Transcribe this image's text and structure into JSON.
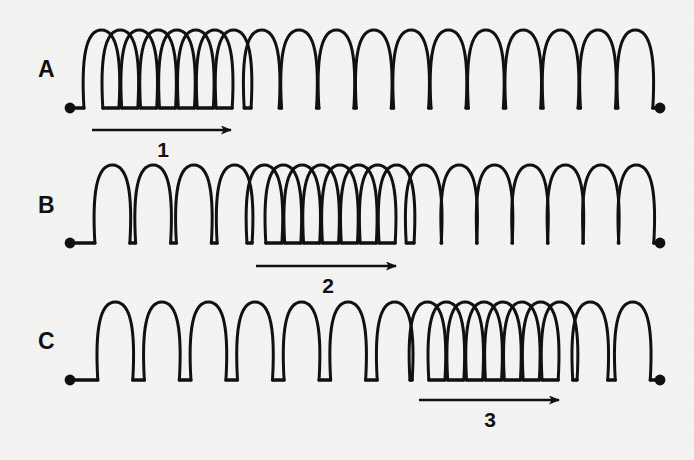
{
  "figure": {
    "background_color": "#f4f4f2",
    "ink_color": "#111111",
    "width": 694,
    "height": 460
  },
  "chart_data": {
    "type": "diagram",
    "xlabel": "",
    "ylabel": "",
    "grid": false,
    "legend": false,
    "springs": [
      {
        "label": "A",
        "label_x": 38,
        "label_y": 58,
        "baseline_y": 108,
        "start_x": 70,
        "end_x": 660,
        "coil_height": 78,
        "compression_start_x": 92,
        "compression_end_x": 243,
        "compressed_coils": 8,
        "sparse_coils_before": 0,
        "sparse_coils_after": 11,
        "arrow": {
          "name": "1",
          "x1": 92,
          "x2": 231,
          "y": 130,
          "label_x": 163,
          "label_y": 139
        }
      },
      {
        "label": "B",
        "label_x": 38,
        "label_y": 194,
        "baseline_y": 243,
        "start_x": 70,
        "end_x": 660,
        "coil_height": 78,
        "compression_start_x": 255,
        "compression_end_x": 406,
        "compressed_coils": 8,
        "sparse_coils_before": 4,
        "sparse_coils_after": 7,
        "arrow": {
          "name": "2",
          "x1": 256,
          "x2": 396,
          "y": 266,
          "label_x": 328,
          "label_y": 275
        }
      },
      {
        "label": "C",
        "label_x": 38,
        "label_y": 330,
        "baseline_y": 380,
        "start_x": 70,
        "end_x": 660,
        "coil_height": 78,
        "compression_start_x": 418,
        "compression_end_x": 569,
        "compressed_coils": 8,
        "sparse_coils_before": 7,
        "sparse_coils_after": 2,
        "arrow": {
          "name": "3",
          "x1": 419,
          "x2": 559,
          "y": 400,
          "label_x": 490,
          "label_y": 409
        }
      }
    ],
    "arrows": [
      {
        "name": "1",
        "meaning": "direction of pulse travel in spring A"
      },
      {
        "name": "2",
        "meaning": "direction of pulse travel in spring B"
      },
      {
        "name": "3",
        "meaning": "direction of pulse travel in spring C"
      }
    ]
  }
}
